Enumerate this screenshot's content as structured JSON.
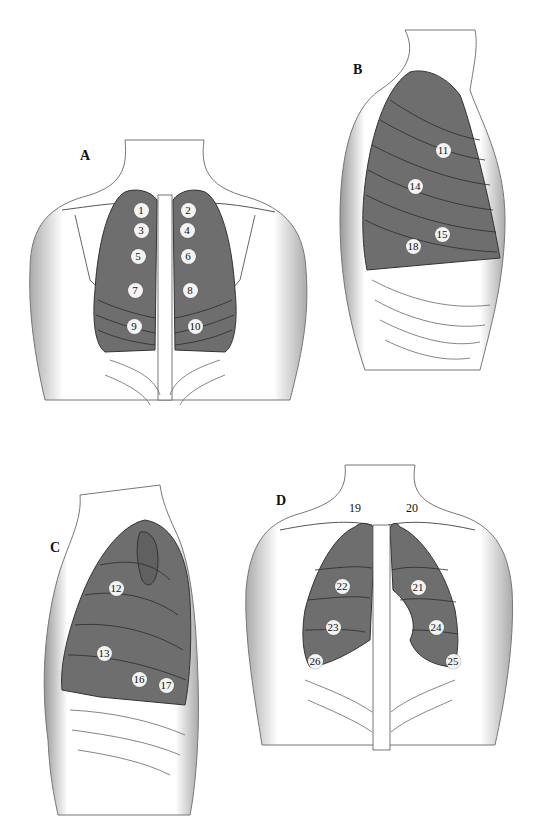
{
  "colors": {
    "lung_fill": "#6e6e6e",
    "skin_shade": "#bdbdbd",
    "outline": "#333333",
    "background": "#ffffff",
    "marker_bg": "#f4f4f4"
  },
  "panels": [
    {
      "id": "A",
      "label": "A",
      "view": "posterior chest",
      "markers": [
        {
          "n": "1",
          "x": 141,
          "y": 210
        },
        {
          "n": "2",
          "x": 188,
          "y": 210
        },
        {
          "n": "3",
          "x": 141,
          "y": 230
        },
        {
          "n": "4",
          "x": 187,
          "y": 230
        },
        {
          "n": "5",
          "x": 138,
          "y": 256
        },
        {
          "n": "6",
          "x": 188,
          "y": 256
        },
        {
          "n": "7",
          "x": 135,
          "y": 290
        },
        {
          "n": "8",
          "x": 190,
          "y": 290
        },
        {
          "n": "9",
          "x": 134,
          "y": 326
        },
        {
          "n": "10",
          "x": 195,
          "y": 326
        }
      ]
    },
    {
      "id": "B",
      "label": "B",
      "view": "right lateral chest",
      "markers": [
        {
          "n": "11",
          "x": 443,
          "y": 150
        },
        {
          "n": "14",
          "x": 415,
          "y": 186
        },
        {
          "n": "15",
          "x": 442,
          "y": 234
        },
        {
          "n": "18",
          "x": 413,
          "y": 246
        }
      ]
    },
    {
      "id": "C",
      "label": "C",
      "view": "left lateral chest",
      "markers": [
        {
          "n": "12",
          "x": 116,
          "y": 588
        },
        {
          "n": "13",
          "x": 104,
          "y": 653
        },
        {
          "n": "16",
          "x": 139,
          "y": 679
        },
        {
          "n": "17",
          "x": 166,
          "y": 685
        }
      ]
    },
    {
      "id": "D",
      "label": "D",
      "view": "anterior chest",
      "markers": [
        {
          "n": "19",
          "x": 355,
          "y": 508,
          "plain": true
        },
        {
          "n": "20",
          "x": 412,
          "y": 508,
          "plain": true
        },
        {
          "n": "21",
          "x": 418,
          "y": 587
        },
        {
          "n": "22",
          "x": 342,
          "y": 586
        },
        {
          "n": "23",
          "x": 333,
          "y": 627
        },
        {
          "n": "24",
          "x": 436,
          "y": 627
        },
        {
          "n": "25",
          "x": 453,
          "y": 661
        },
        {
          "n": "26",
          "x": 315,
          "y": 661
        }
      ]
    }
  ]
}
